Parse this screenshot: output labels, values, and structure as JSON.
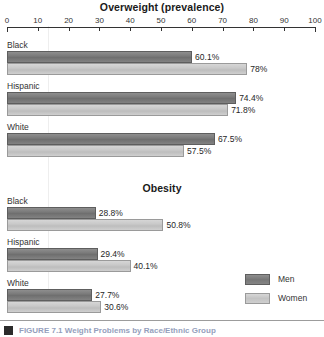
{
  "chart_data": {
    "type": "bar",
    "orientation": "horizontal",
    "title": "Overweight (prevalence)",
    "xlabel": "",
    "ylabel": "",
    "xlim": [
      0,
      100
    ],
    "grid": false,
    "legend_position": "bottom-right",
    "axis_ticks": [
      0,
      10,
      20,
      30,
      40,
      50,
      60,
      70,
      80,
      90,
      100
    ],
    "legend": [
      {
        "name": "Men",
        "color": "#7b7b7b"
      },
      {
        "name": "Women",
        "color": "#c9c9c9"
      }
    ],
    "panels": [
      {
        "title": "Overweight (prevalence)",
        "categories": [
          "Black",
          "Hispanic",
          "White"
        ],
        "series": [
          {
            "name": "Men",
            "values": [
              60.1,
              74.4,
              67.5
            ],
            "labels": [
              "60.1%",
              "74.4%",
              "67.5%"
            ]
          },
          {
            "name": "Women",
            "values": [
              78.0,
              71.8,
              57.5
            ],
            "labels": [
              "78%",
              "71.8%",
              "57.5%"
            ]
          }
        ]
      },
      {
        "title": "Obesity",
        "categories": [
          "Black",
          "Hispanic",
          "White"
        ],
        "series": [
          {
            "name": "Men",
            "values": [
              28.8,
              29.4,
              27.7
            ],
            "labels": [
              "28.8%",
              "29.4%",
              "27.7%"
            ]
          },
          {
            "name": "Women",
            "values": [
              50.8,
              40.1,
              30.6
            ],
            "labels": [
              "50.8%",
              "40.1%",
              "30.6%"
            ]
          }
        ]
      }
    ]
  },
  "footer": {
    "caption": "FIGURE 7.1  Weight Problems by Race/Ethnic Group"
  }
}
